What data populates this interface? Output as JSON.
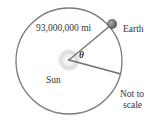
{
  "diagram": {
    "distance_label": "93,000,000 mi",
    "earth_label": "Earth",
    "sun_label": "Sun",
    "angle_label": "θ",
    "note_line1": "Not to",
    "note_line2": "scale"
  },
  "colors": {
    "orbit": "#7a7a7a",
    "radius_lines": "#6f6f6f",
    "sun_glow": "#d8d8d8",
    "earth": "#6a6a6a",
    "text": "#333333"
  }
}
